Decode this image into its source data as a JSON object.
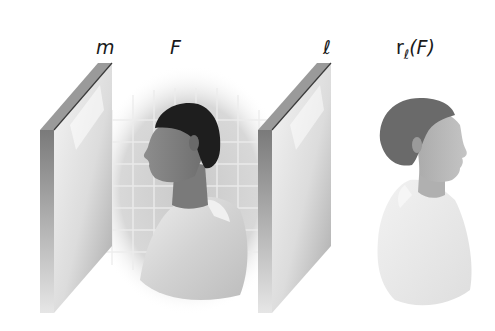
{
  "figure": {
    "labels": {
      "mirror_m": "m",
      "figure_F": "F",
      "mirror_l": "ℓ",
      "reflection_prefix": "r",
      "reflection_subscript": "ℓ",
      "reflection_arg": "(F)"
    },
    "elements": [
      {
        "id": "mirror-m",
        "type": "mirror",
        "label": "m"
      },
      {
        "id": "figure-F",
        "type": "person-profile-facing-right-then-left",
        "label": "F"
      },
      {
        "id": "mirror-l",
        "type": "mirror",
        "label": "ℓ"
      },
      {
        "id": "image-rF",
        "type": "reflected-person-faded",
        "label": "rℓ(F)"
      }
    ],
    "colors": {
      "background": "#ffffff",
      "mirror_edge": "#8a8a8a",
      "hair_original": "#1e1e1e",
      "hair_reflection": "#6a6a6a",
      "tile_grid": "#c8c8c8"
    }
  }
}
